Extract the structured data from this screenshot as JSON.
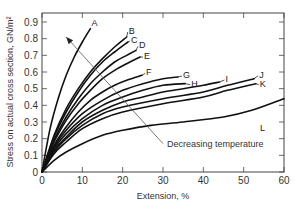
{
  "chart_data": {
    "type": "line",
    "title": "",
    "xlabel": "Extension, %",
    "ylabel": "Stress on actual cross section, GN/m²",
    "xlim": [
      0,
      60
    ],
    "ylim": [
      0,
      0.95
    ],
    "xticks": [
      0,
      10,
      20,
      30,
      40,
      50,
      60
    ],
    "yticks": [
      0,
      0.1,
      0.2,
      0.3,
      0.4,
      0.5,
      0.6,
      0.7,
      0.8,
      0.9
    ],
    "xtick_labels": [
      "0",
      "10",
      "20",
      "30",
      "40",
      "50",
      "60"
    ],
    "ytick_labels": [
      "0",
      "0.1",
      "0.2",
      "0.3",
      "0.4",
      "0.5",
      "0.6",
      "0.7",
      "0.8",
      "0.9"
    ],
    "grid": false,
    "legend": "inline curve labels A–L at curve ends",
    "annotation": {
      "text": "Decreasing temperature",
      "arrow_from": [
        30,
        0.17
      ],
      "arrow_to": [
        6,
        0.81
      ]
    },
    "series": [
      {
        "name": "A",
        "x": [
          0,
          2,
          4,
          6,
          8,
          10,
          12
        ],
        "y": [
          0,
          0.26,
          0.44,
          0.58,
          0.69,
          0.78,
          0.86
        ]
      },
      {
        "name": "B",
        "x": [
          0,
          3,
          6,
          9,
          12,
          15,
          18,
          21
        ],
        "y": [
          0,
          0.22,
          0.38,
          0.5,
          0.6,
          0.68,
          0.75,
          0.81
        ]
      },
      {
        "name": "C",
        "x": [
          0,
          3,
          6,
          9,
          12,
          15,
          18,
          21.3
        ],
        "y": [
          0,
          0.21,
          0.36,
          0.48,
          0.58,
          0.66,
          0.72,
          0.78
        ]
      },
      {
        "name": "D",
        "x": [
          0,
          3,
          6,
          9,
          12,
          15,
          18,
          21,
          23.3
        ],
        "y": [
          0,
          0.19,
          0.33,
          0.44,
          0.53,
          0.6,
          0.66,
          0.7,
          0.73
        ]
      },
      {
        "name": "E",
        "x": [
          0,
          3,
          6,
          9,
          12,
          15,
          18,
          21,
          24.3
        ],
        "y": [
          0,
          0.18,
          0.31,
          0.41,
          0.49,
          0.56,
          0.61,
          0.65,
          0.69
        ]
      },
      {
        "name": "F",
        "x": [
          0,
          3,
          6,
          9,
          12,
          15,
          18,
          21,
          24.8
        ],
        "y": [
          0,
          0.16,
          0.27,
          0.36,
          0.43,
          0.48,
          0.52,
          0.55,
          0.58
        ]
      },
      {
        "name": "G",
        "x": [
          0,
          3,
          6,
          10,
          15,
          20,
          25,
          30,
          33.7
        ],
        "y": [
          0,
          0.15,
          0.25,
          0.35,
          0.43,
          0.49,
          0.53,
          0.56,
          0.57
        ]
      },
      {
        "name": "H",
        "x": [
          0,
          3,
          6,
          10,
          15,
          20,
          25,
          30,
          35.5
        ],
        "y": [
          0,
          0.14,
          0.23,
          0.32,
          0.4,
          0.45,
          0.49,
          0.52,
          0.53
        ]
      },
      {
        "name": "I",
        "x": [
          0,
          3,
          6,
          10,
          15,
          20,
          25,
          30,
          35,
          40,
          44
        ],
        "y": [
          0,
          0.13,
          0.21,
          0.3,
          0.37,
          0.42,
          0.45,
          0.48,
          0.5,
          0.52,
          0.54
        ]
      },
      {
        "name": "J",
        "x": [
          0,
          3,
          6,
          10,
          15,
          20,
          30,
          40,
          46,
          52.6
        ],
        "y": [
          0,
          0.12,
          0.2,
          0.28,
          0.35,
          0.39,
          0.44,
          0.48,
          0.52,
          0.56
        ]
      },
      {
        "name": "K",
        "x": [
          0,
          3,
          6,
          10,
          15,
          20,
          30,
          40,
          46,
          53
        ],
        "y": [
          0,
          0.11,
          0.18,
          0.26,
          0.32,
          0.36,
          0.41,
          0.45,
          0.49,
          0.53
        ]
      },
      {
        "name": "L",
        "x": [
          0,
          3,
          6,
          10,
          15,
          20,
          27,
          35,
          45,
          52,
          60
        ],
        "y": [
          0,
          0.07,
          0.12,
          0.17,
          0.22,
          0.25,
          0.28,
          0.3,
          0.33,
          0.37,
          0.44
        ]
      }
    ]
  }
}
